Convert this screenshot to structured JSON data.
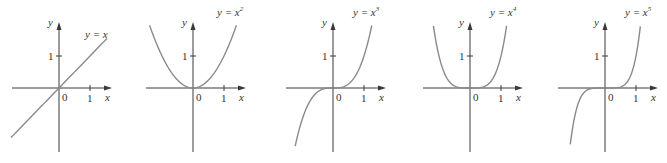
{
  "chart_data": [
    {
      "type": "line",
      "title": "y = x",
      "label": "y = x",
      "exponent": "",
      "n": 1,
      "xlabel": "x",
      "ylabel": "y",
      "x_ticks": [
        "0",
        "1"
      ],
      "y_ticks": [
        "1"
      ],
      "xlim": [
        -1.6,
        1.7
      ],
      "ylim": [
        -2.0,
        2.1
      ],
      "grid": false,
      "series": [
        {
          "name": "y = x",
          "x": [
            -1.55,
            -1,
            0,
            1,
            1.55
          ],
          "y": [
            -1.55,
            -1,
            0,
            1,
            1.55
          ]
        }
      ]
    },
    {
      "type": "line",
      "title": "y = x^2",
      "label": "y = x",
      "exponent": "2",
      "n": 2,
      "xlabel": "x",
      "ylabel": "y",
      "x_ticks": [
        "0",
        "1"
      ],
      "y_ticks": [
        "1"
      ],
      "xlim": [
        -1.6,
        1.7
      ],
      "ylim": [
        -2.0,
        2.1
      ],
      "grid": false,
      "series": [
        {
          "name": "y = x^2",
          "x": [
            -1.4,
            -1,
            -0.5,
            0,
            0.5,
            1,
            1.4
          ],
          "y": [
            1.96,
            1,
            0.25,
            0,
            0.25,
            1,
            1.96
          ]
        }
      ]
    },
    {
      "type": "line",
      "title": "y = x^3",
      "label": "y = x",
      "exponent": "3",
      "n": 3,
      "xlabel": "x",
      "ylabel": "y",
      "x_ticks": [
        "0",
        "1"
      ],
      "y_ticks": [
        "1"
      ],
      "xlim": [
        -1.6,
        1.7
      ],
      "ylim": [
        -2.0,
        2.1
      ],
      "grid": false,
      "series": [
        {
          "name": "y = x^3",
          "x": [
            -1.22,
            -1,
            -0.5,
            0,
            0.5,
            1,
            1.25
          ],
          "y": [
            -1.82,
            -1,
            -0.125,
            0,
            0.125,
            1,
            1.95
          ]
        }
      ]
    },
    {
      "type": "line",
      "title": "y = x^4",
      "label": "y = x",
      "exponent": "4",
      "n": 4,
      "xlabel": "x",
      "ylabel": "y",
      "x_ticks": [
        "0",
        "1"
      ],
      "y_ticks": [
        "1"
      ],
      "xlim": [
        -1.6,
        1.7
      ],
      "ylim": [
        -2.0,
        2.1
      ],
      "grid": false,
      "series": [
        {
          "name": "y = x^4",
          "x": [
            -1.18,
            -1,
            -0.5,
            0,
            0.5,
            1,
            1.18
          ],
          "y": [
            1.94,
            1,
            0.0625,
            0,
            0.0625,
            1,
            1.94
          ]
        }
      ]
    },
    {
      "type": "line",
      "title": "y = x^5",
      "label": "y = x",
      "exponent": "5",
      "n": 5,
      "xlabel": "x",
      "ylabel": "y",
      "x_ticks": [
        "0",
        "1"
      ],
      "y_ticks": [
        "1"
      ],
      "xlim": [
        -1.6,
        1.7
      ],
      "ylim": [
        -2.0,
        2.1
      ],
      "grid": false,
      "series": [
        {
          "name": "y = x^5",
          "x": [
            -1.12,
            -1,
            -0.5,
            0,
            0.5,
            1,
            1.14
          ],
          "y": [
            -1.76,
            -1,
            -0.03,
            0,
            0.03,
            1,
            1.93
          ]
        }
      ]
    }
  ],
  "colors": {
    "axis": "#3a3a3a",
    "curve": "#8a8a8a",
    "text": "#333333",
    "background": "#ffffff"
  },
  "panels": [
    {
      "ox": 59,
      "oy": 88
    },
    {
      "ox": 193,
      "oy": 88
    },
    {
      "ox": 333,
      "oy": 88
    },
    {
      "ox": 470,
      "oy": 88
    },
    {
      "ox": 605,
      "oy": 88
    }
  ]
}
